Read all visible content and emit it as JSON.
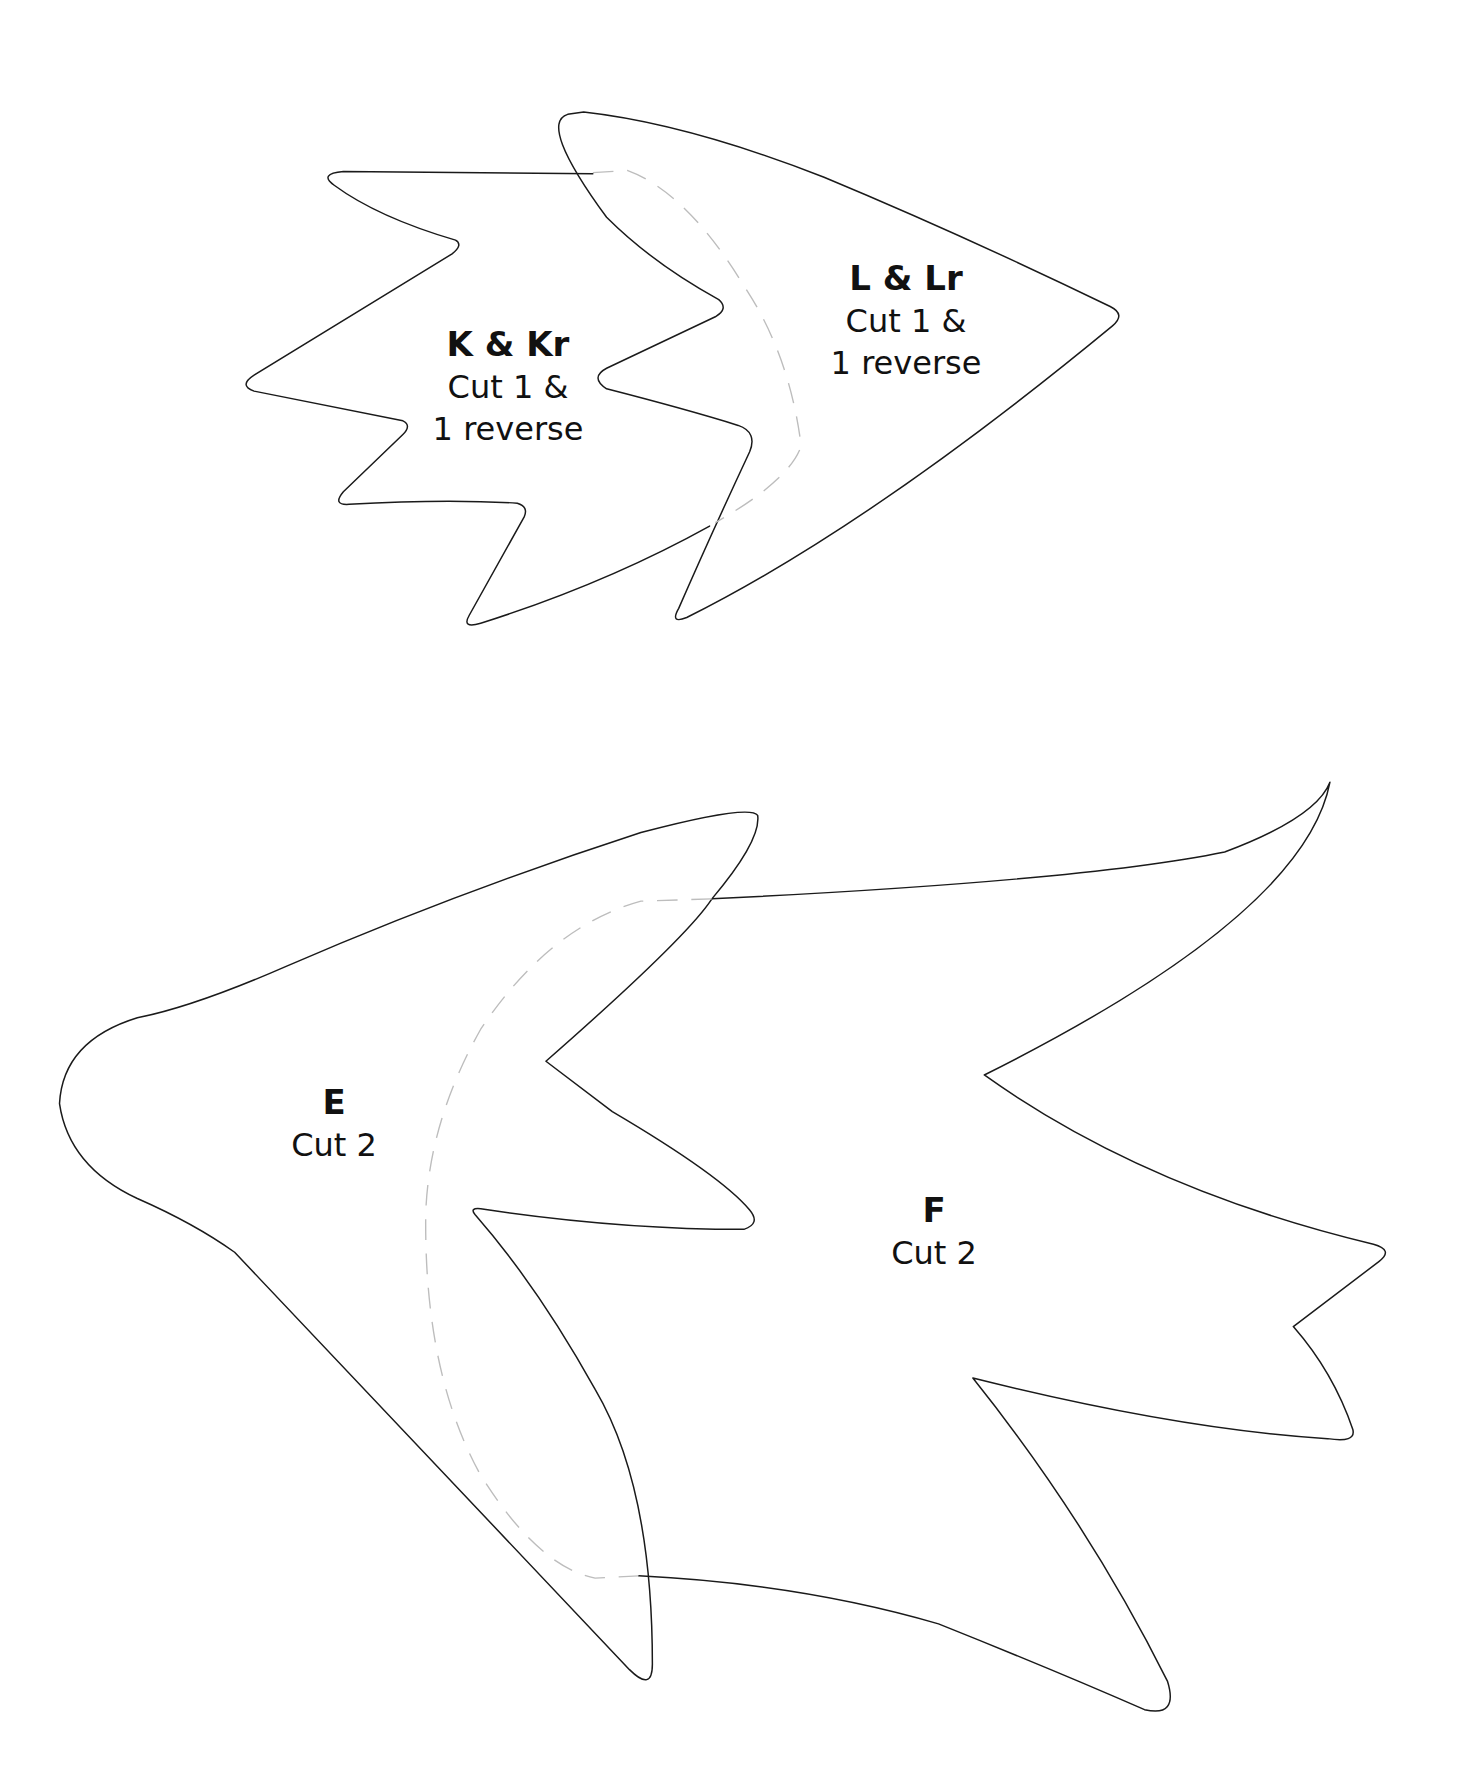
{
  "pieces": [
    {
      "id": "K",
      "name": "K & Kr",
      "instruction_line1": "Cut 1 &",
      "instruction_line2": "1 reverse"
    },
    {
      "id": "L",
      "name": "L & Lr",
      "instruction_line1": "Cut 1 &",
      "instruction_line2": "1 reverse"
    },
    {
      "id": "E",
      "name": "E",
      "instruction_line1": "Cut 2",
      "instruction_line2": ""
    },
    {
      "id": "F",
      "name": "F",
      "instruction_line1": "Cut 2",
      "instruction_line2": ""
    }
  ],
  "colors": {
    "outline": "#1a1a1a",
    "seam": "#bdbdbd",
    "background": "#ffffff"
  }
}
